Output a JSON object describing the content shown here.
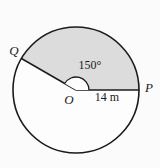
{
  "figure": {
    "labels": {
      "point_q": "Q",
      "point_p": "P",
      "center_o": "O",
      "angle": "150°",
      "radius": "14 m"
    },
    "values": {
      "sector_angle_degrees": 150,
      "radius_measure": "14 m"
    },
    "colors": {
      "sector_fill": "#dcdcdc",
      "circle_fill": "#fdfdfd",
      "line_stroke": "#1b1b1b",
      "angle_marker_fill": "#fdfdfd",
      "background": "#fbfbfb"
    }
  }
}
